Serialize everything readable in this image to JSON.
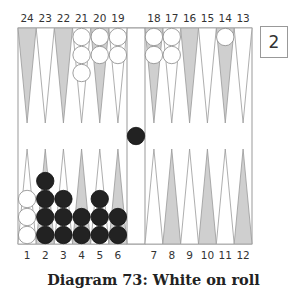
{
  "caption": "Diagram 73: White on roll",
  "cube": {
    "value": "2"
  },
  "colors": {
    "gray_point": "#cfcfcf",
    "white_point": "#ffffff",
    "line": "#999999",
    "black_checker": "#222222",
    "white_checker": "#ffffff"
  },
  "top_labels": [
    "24",
    "23",
    "22",
    "21",
    "20",
    "19",
    "18",
    "17",
    "16",
    "15",
    "14",
    "13"
  ],
  "bottom_labels": [
    "1",
    "2",
    "3",
    "4",
    "5",
    "6",
    "7",
    "8",
    "9",
    "10",
    "11",
    "12"
  ],
  "position": {
    "white": {
      "21": 3,
      "20": 2,
      "19": 2,
      "18": 2,
      "17": 2,
      "14": 1,
      "1": 3
    },
    "black": {
      "2": 4,
      "3": 3,
      "4": 2,
      "5": 3,
      "6": 2,
      "bar": 1
    }
  }
}
